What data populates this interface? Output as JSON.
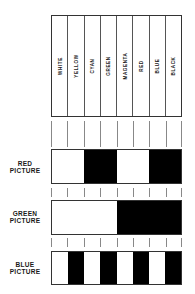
{
  "diagram": {
    "title": "",
    "columns": [
      "WHITE",
      "YELLOW",
      "CYAN",
      "GREEN",
      "MAGENTA",
      "RED",
      "BLUE",
      "BLACK"
    ],
    "rows": [
      {
        "label_line1": "RED",
        "label_line2": "PICTURE",
        "pattern": [
          1,
          1,
          0,
          0,
          1,
          1,
          0,
          0
        ]
      },
      {
        "label_line1": "GREEN",
        "label_line2": "PICTURE",
        "pattern": [
          1,
          1,
          1,
          1,
          0,
          0,
          0,
          0
        ]
      },
      {
        "label_line1": "BLUE",
        "label_line2": "PICTURE",
        "pattern": [
          1,
          0,
          1,
          0,
          1,
          0,
          1,
          0
        ]
      }
    ],
    "colors": {
      "on": "#ffffff",
      "off": "#000000",
      "line": "#333333"
    }
  }
}
